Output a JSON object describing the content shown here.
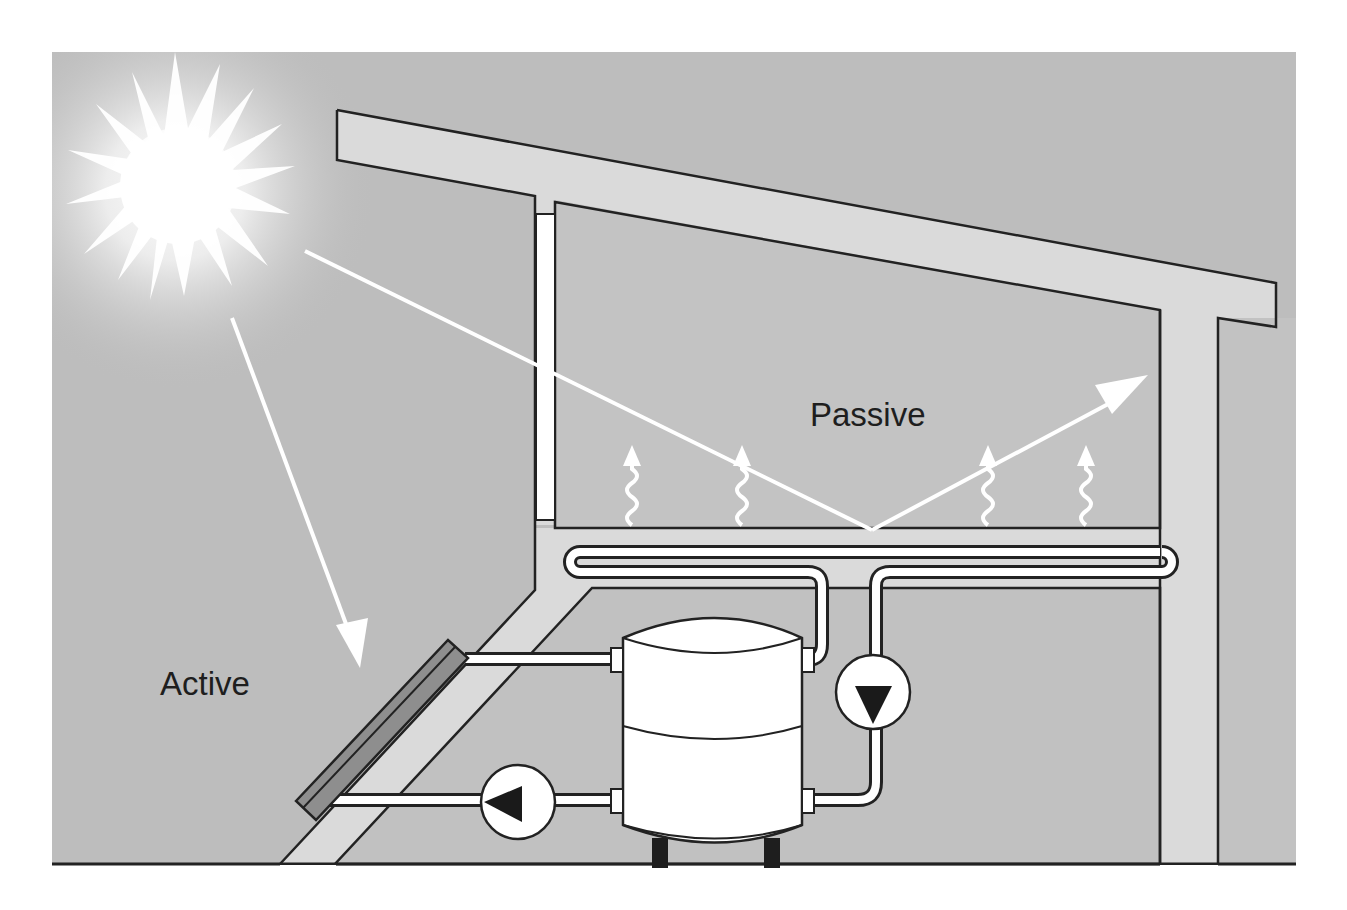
{
  "diagram": {
    "labels": {
      "passive": "Passive",
      "active": "Active"
    },
    "components": {
      "sun": "sun",
      "roof": "roof-beam",
      "window": "south-facing-window",
      "floor_slab": "thermal-mass-floor",
      "floor_coil": "floor-heating-coil",
      "collector": "solar-collector-panel",
      "tank": "storage-tank",
      "pump_collector": "collector-circuit-pump",
      "pump_floor": "floor-circuit-pump",
      "post": "support-post"
    },
    "colors": {
      "background": "#bdbdbd",
      "room_fill": "#c4c4c4",
      "structure_fill": "#dadada",
      "outline": "#222222",
      "light": "#ffffff",
      "collector_fill": "#8e8e8e",
      "pump_arrow": "#1a1a1a"
    },
    "heat_waves": [
      {
        "x": 632
      },
      {
        "x": 742
      },
      {
        "x": 988
      },
      {
        "x": 1086
      }
    ]
  }
}
